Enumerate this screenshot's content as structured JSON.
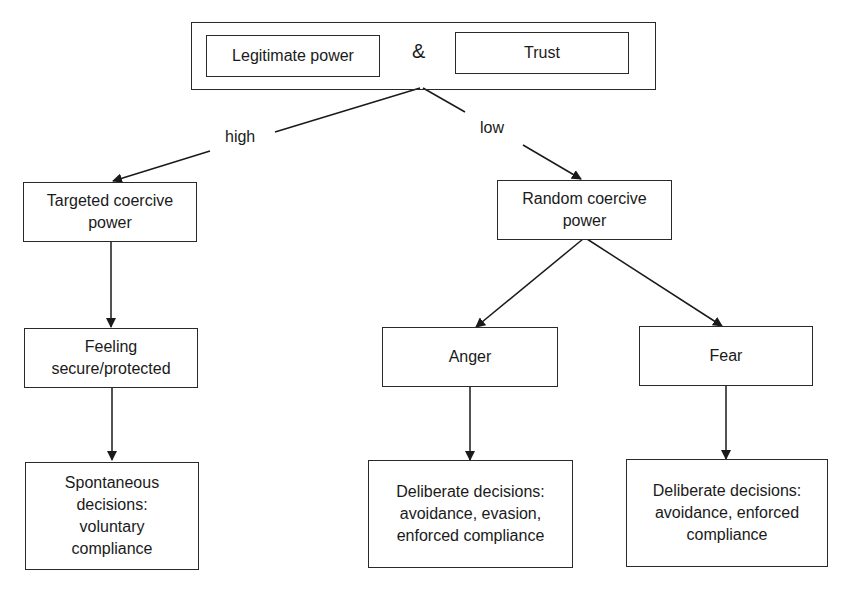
{
  "diagram": {
    "top": {
      "left_box": "Legitimate power",
      "connector": "&",
      "right_box": "Trust"
    },
    "edges": {
      "high_label": "high",
      "low_label": "low"
    },
    "left_branch": {
      "node1": "Targeted coercive\npower",
      "node2": "Feeling\nsecure/protected",
      "node3": "Spontaneous\ndecisions:\nvoluntary\ncompliance"
    },
    "right_branch": {
      "node1": "Random coercive\npower",
      "anger": "Anger",
      "fear": "Fear",
      "anger_outcome": "Deliberate decisions:\navoidance, evasion,\nenforced compliance",
      "fear_outcome": "Deliberate decisions:\navoidance, enforced\ncompliance"
    }
  }
}
